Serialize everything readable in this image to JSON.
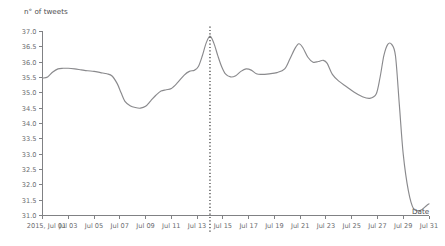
{
  "chart_data": {
    "type": "line",
    "title": "",
    "xlabel": "Date",
    "ylabel": "n° of tweets",
    "ylim": [
      31.0,
      37.0
    ],
    "grid": false,
    "legend": "none",
    "line_color": "#8a8a8d",
    "axis_color": "#808184",
    "marker_color": "#2b2b2b",
    "y_ticks": [
      "37.0",
      "36.5",
      "36.0",
      "35.5",
      "35.0",
      "34.5",
      "34.0",
      "33.5",
      "33.0",
      "32.5",
      "32.0",
      "31.5",
      "31.0"
    ],
    "y_tick_values": [
      37.0,
      36.5,
      36.0,
      35.5,
      35.0,
      34.5,
      34.0,
      33.5,
      33.0,
      32.5,
      32.0,
      31.5,
      31.0
    ],
    "x_ticks": [
      "2015, Jul 01",
      "Jul 03",
      "Jul 05",
      "Jul 07",
      "Jul 09",
      "Jul 11",
      "Jul 13",
      "Jul 15",
      "Jul 17",
      "Jul 19",
      "Jul 21",
      "Jul 23",
      "Jul 25",
      "Jul 27",
      "Jul 29",
      "Jul 31"
    ],
    "x_tick_values": [
      1,
      3,
      5,
      7,
      9,
      11,
      13,
      15,
      17,
      19,
      21,
      23,
      25,
      27,
      29,
      31
    ],
    "xlim": [
      1,
      31
    ],
    "annotations": [
      {
        "name": "vertical-marker",
        "type": "vline",
        "x": 14.0,
        "style": "dotted",
        "label": ""
      }
    ],
    "x": [
      1.0,
      1.4,
      1.8,
      2.2,
      2.6,
      3.0,
      3.5,
      4.0,
      4.5,
      5.0,
      5.5,
      6.0,
      6.4,
      6.8,
      7.1,
      7.4,
      7.8,
      8.2,
      8.6,
      9.0,
      9.4,
      9.8,
      10.2,
      10.6,
      11.0,
      11.5,
      12.0,
      12.4,
      12.8,
      13.1,
      13.4,
      13.7,
      14.0,
      14.3,
      14.6,
      14.9,
      15.2,
      15.6,
      16.0,
      16.4,
      16.8,
      17.2,
      17.6,
      18.0,
      18.6,
      19.2,
      19.8,
      20.2,
      20.6,
      20.9,
      21.2,
      21.6,
      22.0,
      22.4,
      22.8,
      23.1,
      23.5,
      24.0,
      24.6,
      25.2,
      25.8,
      26.4,
      26.9,
      27.2,
      27.5,
      27.8,
      28.1,
      28.4,
      28.7,
      29.0,
      29.4,
      29.8,
      30.3,
      30.8,
      31.0
    ],
    "y": [
      35.48,
      35.52,
      35.68,
      35.78,
      35.8,
      35.8,
      35.78,
      35.75,
      35.72,
      35.7,
      35.66,
      35.62,
      35.55,
      35.3,
      35.0,
      34.72,
      34.58,
      34.52,
      34.5,
      34.56,
      34.74,
      34.92,
      35.06,
      35.1,
      35.14,
      35.34,
      35.58,
      35.7,
      35.74,
      35.86,
      36.2,
      36.62,
      36.85,
      36.62,
      36.22,
      35.86,
      35.62,
      35.52,
      35.56,
      35.7,
      35.78,
      35.74,
      35.62,
      35.6,
      35.62,
      35.66,
      35.78,
      36.1,
      36.45,
      36.6,
      36.48,
      36.16,
      36.0,
      36.02,
      36.06,
      35.96,
      35.6,
      35.38,
      35.2,
      35.02,
      34.88,
      34.82,
      34.96,
      35.5,
      36.22,
      36.58,
      36.58,
      36.2,
      34.6,
      33.0,
      31.8,
      31.22,
      31.16,
      31.32,
      31.38
    ]
  }
}
